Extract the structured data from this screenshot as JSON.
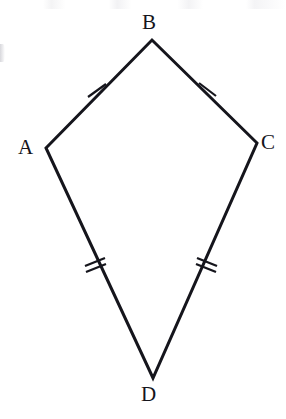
{
  "figure": {
    "shape_type": "kite",
    "stroke_color": "#15151c",
    "fill_color": "none",
    "background_color": "#ffffff",
    "stroke_width": 3,
    "canvas": {
      "width": 286,
      "height": 419
    },
    "vertices": [
      {
        "id": "A",
        "label": "A",
        "x": 46,
        "y": 148
      },
      {
        "id": "B",
        "label": "B",
        "x": 152,
        "y": 40
      },
      {
        "id": "C",
        "label": "C",
        "x": 257,
        "y": 143
      },
      {
        "id": "D",
        "label": "D",
        "x": 153,
        "y": 378
      }
    ],
    "outline_path": "M 46 148 L 152 40 L 257 143 L 153 378 Z",
    "edges": [
      {
        "id": "AB",
        "from": "A",
        "to": "B",
        "tick_count": 1,
        "congruence_group": "short"
      },
      {
        "id": "BC",
        "from": "B",
        "to": "C",
        "tick_count": 1,
        "congruence_group": "short"
      },
      {
        "id": "CD",
        "from": "C",
        "to": "D",
        "tick_count": 2,
        "congruence_group": "long"
      },
      {
        "id": "AD",
        "from": "A",
        "to": "D",
        "tick_count": 2,
        "congruence_group": "long"
      }
    ],
    "tick_marks": [
      {
        "id": "tick-AB",
        "edge": "AB",
        "count": 1,
        "center_x": 97,
        "center_y": 91,
        "strokes": [
          "M 88 97 L 106 84"
        ]
      },
      {
        "id": "tick-BC",
        "edge": "BC",
        "count": 1,
        "center_x": 207,
        "center_y": 89,
        "strokes": [
          "M 199 83 L 216 96"
        ]
      },
      {
        "id": "tick-AD",
        "edge": "AD",
        "count": 2,
        "center_x": 95,
        "center_y": 263,
        "strokes": [
          "M 85 266 L 105 258",
          "M 86 272 L 106 264"
        ]
      },
      {
        "id": "tick-CD",
        "edge": "CD",
        "count": 2,
        "center_x": 207,
        "center_y": 262,
        "strokes": [
          "M 197 258 L 217 266",
          "M 196 264 L 216 272"
        ]
      }
    ],
    "labels": {
      "A": "A",
      "B": "B",
      "C": "C",
      "D": "D"
    }
  }
}
